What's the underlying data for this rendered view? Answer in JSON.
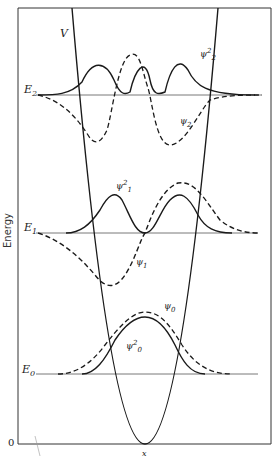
{
  "figure": {
    "y_axis_label": "Energy",
    "origin_label": "0",
    "potential_label": "V",
    "bottom_label": "x",
    "levels": [
      {
        "name": "E2",
        "base": "E",
        "sub": "2",
        "psi": "ψ",
        "psi_sub": "2",
        "psi_sq_sup": "2"
      },
      {
        "name": "E1",
        "base": "E",
        "sub": "1",
        "psi": "ψ",
        "psi_sub": "1",
        "psi_sq_sup": "2"
      },
      {
        "name": "E0",
        "base": "E",
        "sub": "0",
        "psi": "ψ",
        "psi_sub": "0",
        "psi_sq_sup": "2"
      }
    ],
    "legend": {
      "solid": "probability density ψ²",
      "dashed": "wavefunction ψ"
    }
  },
  "colors": {
    "line": "#1a1a1a",
    "frame": "#333333",
    "level": "#555555"
  }
}
